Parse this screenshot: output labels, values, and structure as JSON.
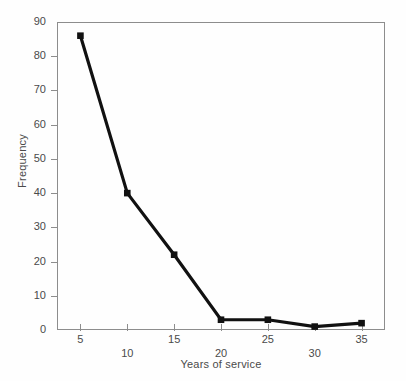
{
  "chart_data": {
    "type": "line",
    "title": "",
    "xlabel": "Years of service",
    "ylabel": "Frequency",
    "categories": [
      5,
      10,
      15,
      20,
      25,
      30,
      35
    ],
    "values": [
      86,
      40,
      22,
      3,
      3,
      1,
      2
    ],
    "series": [
      {
        "name": "Frequency",
        "values": [
          86,
          40,
          22,
          3,
          3,
          1,
          2
        ]
      }
    ],
    "x": [
      5,
      10,
      15,
      20,
      25,
      30,
      35
    ],
    "xlim": [
      2.5,
      37.5
    ],
    "ylim": [
      0,
      90
    ],
    "xticks": [
      5,
      10,
      15,
      20,
      25,
      30,
      35
    ],
    "xtick_labels": [
      "5",
      "10",
      "15",
      "20",
      "25",
      "30",
      "35"
    ],
    "yticks": [
      0,
      10,
      20,
      30,
      40,
      50,
      60,
      70,
      80,
      90
    ],
    "ytick_labels": [
      "0",
      "10",
      "20",
      "30",
      "40",
      "50",
      "60",
      "70",
      "80",
      "90"
    ],
    "grid": false,
    "legend": false,
    "legend_position": "none",
    "marker": "square",
    "line_color": "#111111",
    "marker_color": "#111111",
    "frame_color": "#8d8d8d",
    "background_color": "#fefefe",
    "annotations": []
  }
}
